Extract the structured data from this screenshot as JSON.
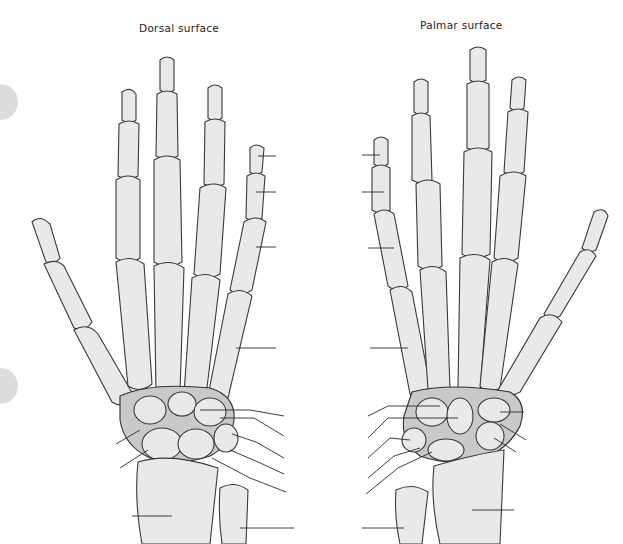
{
  "figure": {
    "views": [
      {
        "id": "dorsal",
        "caption": "Dorsal surface"
      },
      {
        "id": "palmar",
        "caption": "Palmar surface"
      }
    ],
    "leader_line_labels": "unlabeled",
    "page_tabs": 2
  },
  "colors": {
    "background": "#ffffff",
    "bone_fill": "#e9e9e9",
    "bone_outline": "#3a3a3a",
    "tab_gray": "#dcdcdc"
  }
}
